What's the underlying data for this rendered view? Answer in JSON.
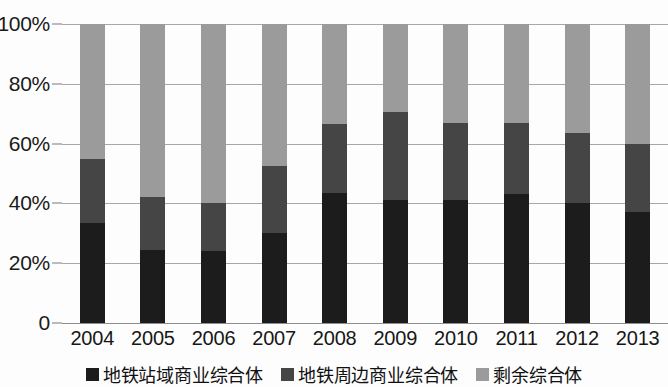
{
  "chart_data": {
    "type": "bar",
    "title": "",
    "subtitle": "",
    "xlabel": "",
    "ylabel": "",
    "stacked": true,
    "stack_total": 100,
    "grid": true,
    "legend_position": "bottom",
    "ylim": [
      0,
      100
    ],
    "y_ticks": [
      "0",
      "20%",
      "40%",
      "60%",
      "80%",
      "100%"
    ],
    "y_tick_values": [
      0,
      20,
      40,
      60,
      80,
      100
    ],
    "categories": [
      "2004",
      "2005",
      "2006",
      "2007",
      "2008",
      "2009",
      "2010",
      "2011",
      "2012",
      "2013"
    ],
    "series": [
      {
        "name": "地铁站域商业综合体",
        "color": "#1c1c1c",
        "values": [
          33.5,
          24.5,
          24,
          30,
          43.5,
          41,
          41,
          43,
          40,
          37
        ]
      },
      {
        "name": "地铁周边商业综合体",
        "color": "#454545",
        "values": [
          21.5,
          17.5,
          16,
          22.5,
          23,
          29.5,
          26,
          24,
          23.5,
          23
        ]
      },
      {
        "name": "剩余综合体",
        "color": "#9b9b9b",
        "values": [
          45,
          58,
          60,
          47.5,
          33.5,
          29.5,
          33,
          33,
          36.5,
          40
        ]
      }
    ]
  },
  "legend": {
    "items": [
      {
        "label": "地铁站域商业综合体",
        "color": "#1c1c1c"
      },
      {
        "label": "地铁周边商业综合体",
        "color": "#454545"
      },
      {
        "label": "剩余综合体",
        "color": "#9b9b9b"
      }
    ]
  }
}
